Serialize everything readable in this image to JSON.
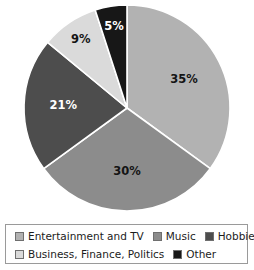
{
  "chart_data": {
    "type": "pie",
    "title": "",
    "legend_position": "bottom",
    "grid": false,
    "categories": [
      "Entertainment and TV",
      "Music",
      "Hobbies",
      "Business, Finance, Politics",
      "Other"
    ],
    "values": [
      35,
      30,
      21,
      9,
      5
    ],
    "labels": [
      "35%",
      "30%",
      "21%",
      "9%",
      "5%"
    ],
    "units": "percent",
    "start_angle_deg": 0,
    "direction": "clockwise",
    "slices": [
      {
        "name": "Entertainment and TV",
        "value": 35,
        "label": "35%",
        "color": "#b2b2b2",
        "label_color": "#141414",
        "start_deg": 0,
        "end_deg": 126
      },
      {
        "name": "Music",
        "value": 30,
        "label": "30%",
        "color": "#8c8c8c",
        "label_color": "#141414",
        "start_deg": 126,
        "end_deg": 234
      },
      {
        "name": "Hobbies",
        "value": 21,
        "label": "21%",
        "color": "#4d4d4d",
        "label_color": "#ffffff",
        "start_deg": 234,
        "end_deg": 309.6
      },
      {
        "name": "Business, Finance, Politics",
        "value": 9,
        "label": "9%",
        "color": "#dadada",
        "label_color": "#141414",
        "start_deg": 309.6,
        "end_deg": 342
      },
      {
        "name": "Other",
        "value": 5,
        "label": "5%",
        "color": "#171717",
        "label_color": "#ffffff",
        "start_deg": 342,
        "end_deg": 360
      }
    ]
  },
  "legend": {
    "rows": [
      [
        {
          "label": "Entertainment and TV",
          "color": "#b2b2b2"
        },
        {
          "label": "Music",
          "color": "#8c8c8c"
        },
        {
          "label": "Hobbies",
          "color": "#4d4d4d"
        }
      ],
      [
        {
          "label": "Business, Finance, Politics",
          "color": "#dadada"
        },
        {
          "label": "Other",
          "color": "#171717"
        }
      ]
    ]
  },
  "geometry": {
    "center_x": 127,
    "center_y": 108,
    "radius": 103,
    "separator_color": "#ffffff",
    "separator_width": 1.6
  }
}
